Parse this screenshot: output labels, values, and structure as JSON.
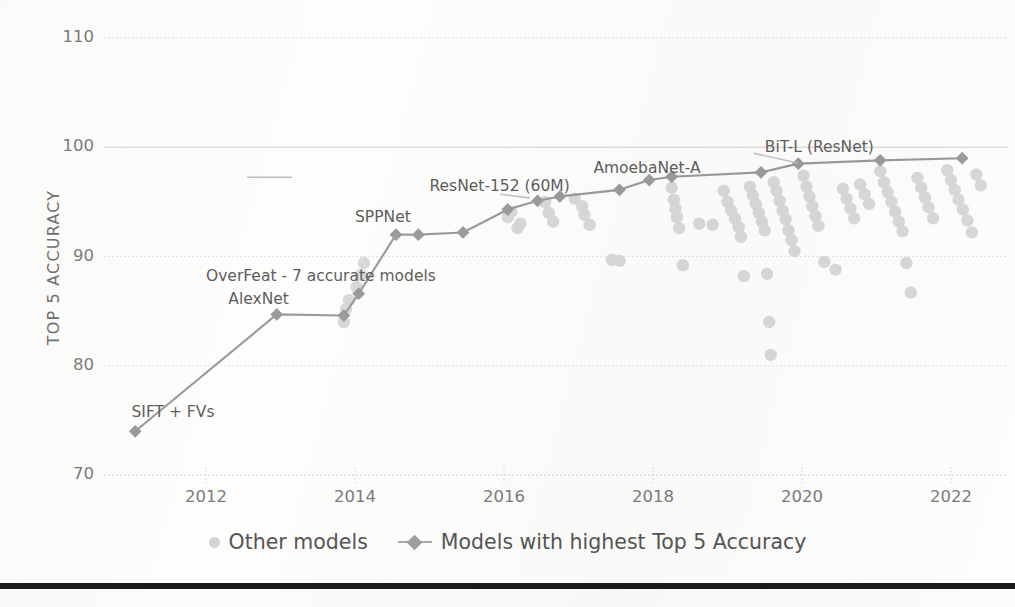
{
  "chart_data": {
    "type": "scatter",
    "title": "",
    "xlabel": "",
    "ylabel": "TOP 5 ACCURACY",
    "xlim": [
      2010.5,
      2022.6
    ],
    "ylim": [
      68.0,
      111.5
    ],
    "grid": true,
    "legend_position": "bottom-center",
    "x_ticks": [
      "2012",
      "2014",
      "2016",
      "2018",
      "2020",
      "2022"
    ],
    "x_tick_values": [
      2012,
      2014,
      2016,
      2018,
      2020,
      2022
    ],
    "y_ticks": [
      "70",
      "80",
      "90",
      "100",
      "110"
    ],
    "y_tick_values": [
      70,
      80,
      90,
      100,
      110
    ],
    "series": [
      {
        "name": "Models with highest Top 5 Accuracy",
        "type": "line",
        "color": "#9a9a9a",
        "marker": "diamond",
        "points": [
          {
            "x": 2011.05,
            "y": 74.0,
            "label": "SIFT + FVs"
          },
          {
            "x": 2012.95,
            "y": 84.7,
            "label": "AlexNet"
          },
          {
            "x": 2013.85,
            "y": 84.6,
            "label": "OverFeat - 7 accurate models"
          },
          {
            "x": 2014.05,
            "y": 86.6,
            "label": ""
          },
          {
            "x": 2014.55,
            "y": 92.0,
            "label": "SPPNet"
          },
          {
            "x": 2014.85,
            "y": 92.0,
            "label": ""
          },
          {
            "x": 2015.45,
            "y": 92.2,
            "label": ""
          },
          {
            "x": 2016.05,
            "y": 94.3,
            "label": ""
          },
          {
            "x": 2016.45,
            "y": 95.1,
            "label": "ResNet-152 (60M)"
          },
          {
            "x": 2016.75,
            "y": 95.5,
            "label": ""
          },
          {
            "x": 2017.55,
            "y": 96.1,
            "label": ""
          },
          {
            "x": 2017.95,
            "y": 97.0,
            "label": ""
          },
          {
            "x": 2018.25,
            "y": 97.3,
            "label": "AmoebaNet-A"
          },
          {
            "x": 2019.45,
            "y": 97.7,
            "label": ""
          },
          {
            "x": 2019.95,
            "y": 98.5,
            "label": "BiT-L (ResNet)"
          },
          {
            "x": 2021.05,
            "y": 98.8,
            "label": ""
          },
          {
            "x": 2022.15,
            "y": 99.0,
            "label": ""
          }
        ]
      },
      {
        "name": "Other models",
        "type": "scatter",
        "color": "#d6d6d6",
        "marker": "circle",
        "points": [
          {
            "x": 2013.85,
            "y": 84.0
          },
          {
            "x": 2013.88,
            "y": 85.2
          },
          {
            "x": 2013.92,
            "y": 86.0
          },
          {
            "x": 2014.02,
            "y": 87.2
          },
          {
            "x": 2014.08,
            "y": 88.3
          },
          {
            "x": 2014.12,
            "y": 89.4
          },
          {
            "x": 2016.05,
            "y": 93.6
          },
          {
            "x": 2016.1,
            "y": 94.1
          },
          {
            "x": 2016.18,
            "y": 92.6
          },
          {
            "x": 2016.22,
            "y": 93.0
          },
          {
            "x": 2016.55,
            "y": 95.0
          },
          {
            "x": 2016.6,
            "y": 94.0
          },
          {
            "x": 2016.66,
            "y": 93.2
          },
          {
            "x": 2016.95,
            "y": 95.3
          },
          {
            "x": 2017.05,
            "y": 94.6
          },
          {
            "x": 2017.08,
            "y": 93.8
          },
          {
            "x": 2017.15,
            "y": 92.9
          },
          {
            "x": 2017.45,
            "y": 89.7
          },
          {
            "x": 2017.55,
            "y": 89.6
          },
          {
            "x": 2018.25,
            "y": 96.3
          },
          {
            "x": 2018.28,
            "y": 95.2
          },
          {
            "x": 2018.3,
            "y": 94.4
          },
          {
            "x": 2018.32,
            "y": 93.6
          },
          {
            "x": 2018.35,
            "y": 92.6
          },
          {
            "x": 2018.4,
            "y": 89.2
          },
          {
            "x": 2018.62,
            "y": 93.0
          },
          {
            "x": 2018.8,
            "y": 92.9
          },
          {
            "x": 2018.95,
            "y": 96.0
          },
          {
            "x": 2019.0,
            "y": 95.0
          },
          {
            "x": 2019.05,
            "y": 94.2
          },
          {
            "x": 2019.1,
            "y": 93.5
          },
          {
            "x": 2019.15,
            "y": 92.7
          },
          {
            "x": 2019.18,
            "y": 91.8
          },
          {
            "x": 2019.22,
            "y": 88.2
          },
          {
            "x": 2019.3,
            "y": 96.4
          },
          {
            "x": 2019.34,
            "y": 95.6
          },
          {
            "x": 2019.38,
            "y": 94.8
          },
          {
            "x": 2019.42,
            "y": 94.0
          },
          {
            "x": 2019.46,
            "y": 93.2
          },
          {
            "x": 2019.5,
            "y": 92.4
          },
          {
            "x": 2019.53,
            "y": 88.4
          },
          {
            "x": 2019.56,
            "y": 84.0
          },
          {
            "x": 2019.58,
            "y": 81.0
          },
          {
            "x": 2019.62,
            "y": 96.8
          },
          {
            "x": 2019.66,
            "y": 96.0
          },
          {
            "x": 2019.7,
            "y": 95.1
          },
          {
            "x": 2019.74,
            "y": 94.2
          },
          {
            "x": 2019.78,
            "y": 93.4
          },
          {
            "x": 2019.82,
            "y": 92.4
          },
          {
            "x": 2019.86,
            "y": 91.5
          },
          {
            "x": 2019.9,
            "y": 90.5
          },
          {
            "x": 2020.02,
            "y": 97.4
          },
          {
            "x": 2020.06,
            "y": 96.4
          },
          {
            "x": 2020.1,
            "y": 95.5
          },
          {
            "x": 2020.14,
            "y": 94.6
          },
          {
            "x": 2020.18,
            "y": 93.7
          },
          {
            "x": 2020.22,
            "y": 92.8
          },
          {
            "x": 2020.3,
            "y": 89.5
          },
          {
            "x": 2020.45,
            "y": 88.8
          },
          {
            "x": 2020.55,
            "y": 96.2
          },
          {
            "x": 2020.6,
            "y": 95.3
          },
          {
            "x": 2020.65,
            "y": 94.4
          },
          {
            "x": 2020.7,
            "y": 93.5
          },
          {
            "x": 2020.78,
            "y": 96.6
          },
          {
            "x": 2020.84,
            "y": 95.7
          },
          {
            "x": 2020.9,
            "y": 94.8
          },
          {
            "x": 2021.05,
            "y": 97.8
          },
          {
            "x": 2021.1,
            "y": 96.8
          },
          {
            "x": 2021.15,
            "y": 95.9
          },
          {
            "x": 2021.2,
            "y": 95.0
          },
          {
            "x": 2021.25,
            "y": 94.1
          },
          {
            "x": 2021.3,
            "y": 93.2
          },
          {
            "x": 2021.35,
            "y": 92.3
          },
          {
            "x": 2021.4,
            "y": 89.4
          },
          {
            "x": 2021.46,
            "y": 86.7
          },
          {
            "x": 2021.55,
            "y": 97.2
          },
          {
            "x": 2021.6,
            "y": 96.3
          },
          {
            "x": 2021.65,
            "y": 95.4
          },
          {
            "x": 2021.7,
            "y": 94.5
          },
          {
            "x": 2021.76,
            "y": 93.5
          },
          {
            "x": 2021.95,
            "y": 97.9
          },
          {
            "x": 2022.0,
            "y": 97.0
          },
          {
            "x": 2022.05,
            "y": 96.1
          },
          {
            "x": 2022.1,
            "y": 95.2
          },
          {
            "x": 2022.16,
            "y": 94.3
          },
          {
            "x": 2022.22,
            "y": 93.3
          },
          {
            "x": 2022.28,
            "y": 92.2
          },
          {
            "x": 2022.34,
            "y": 97.5
          },
          {
            "x": 2022.4,
            "y": 96.5
          }
        ]
      }
    ],
    "annotations": [
      {
        "text": "SIFT + FVs",
        "x": 2011.0,
        "y": 75.6
      },
      {
        "text": "AlexNet",
        "x": 2012.3,
        "y": 85.9
      },
      {
        "text": "OverFeat - 7 accurate models",
        "x": 2012.0,
        "y": 88.0
      },
      {
        "text": "SPPNet",
        "x": 2014.0,
        "y": 93.4
      },
      {
        "text": "ResNet-152 (60M)",
        "x": 2015.0,
        "y": 96.3
      },
      {
        "text": "AmoebaNet-A",
        "x": 2017.2,
        "y": 97.9
      },
      {
        "text": "BiT-L (ResNet)",
        "x": 2019.5,
        "y": 99.8
      }
    ]
  },
  "legend": {
    "items": [
      {
        "label": "Other models",
        "marker": "dot",
        "color": "#d6d6d6"
      },
      {
        "label": "Models with highest Top 5 Accuracy",
        "marker": "line-diamond",
        "color": "#9e9e9e"
      }
    ]
  },
  "axis": {
    "y_title": "TOP 5 ACCURACY"
  },
  "colors": {
    "grid": "#dcdcdc",
    "highlight_line": "#9a9a9a",
    "highlight_marker": "#9b9b9b",
    "other_marker": "#d8d8d8",
    "text": "#6f6f6f",
    "bottom_rule": "#1b1b1b",
    "background": "#fdfdfb"
  }
}
